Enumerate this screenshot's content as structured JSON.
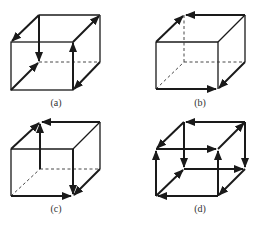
{
  "figure": {
    "panels": [
      {
        "id": "a",
        "label": "(a)",
        "origin": [
          11,
          15
        ],
        "description": "Cube with arrows: back-top-left vertical edge down, front-top-right vertical edge up, top-left depth edge toward front, bottom-left depth edge toward back, top-right depth edge toward back, bottom-right depth edge toward front",
        "arrows": [
          {
            "edge": "BTL-BBL",
            "dir": "down"
          },
          {
            "edge": "FBR-FTR",
            "dir": "up"
          },
          {
            "edge": "BTL-FTL",
            "dir": "to-front"
          },
          {
            "edge": "FBL-BBL",
            "dir": "to-back"
          },
          {
            "edge": "FTR-BTR",
            "dir": "to-back"
          },
          {
            "edge": "BBR-FBR",
            "dir": "to-front"
          }
        ]
      },
      {
        "id": "b",
        "label": "(b)",
        "origin": [
          156,
          15
        ],
        "description": "Cube with arrow loop: front-left-bottom to front-right-bottom, to back-right-top via right side, across back-top to left, down front-left-top",
        "arrows": [
          {
            "edge": "FTL-BTL",
            "dir": "to-back"
          },
          {
            "edge": "BTR-BTL",
            "dir": "left"
          },
          {
            "edge": "FBL-FBR",
            "dir": "right"
          },
          {
            "edge": "BBR-FBR",
            "dir": "to-front"
          }
        ]
      },
      {
        "id": "c",
        "label": "(c)",
        "origin": [
          11,
          122
        ],
        "description": "Cube with arrows: back-left vertical up, back-top leftward, front-left-top depth to back, front-right vertical down, front-bottom rightward, bottom-right depth to front",
        "arrows": [
          {
            "edge": "BBL-BTL",
            "dir": "up"
          },
          {
            "edge": "BTR-BTL",
            "dir": "left"
          },
          {
            "edge": "FTL-BTL",
            "dir": "to-back"
          },
          {
            "edge": "FTR-FBR",
            "dir": "down"
          },
          {
            "edge": "FBL-FBR",
            "dir": "right"
          },
          {
            "edge": "BBR-FBR",
            "dir": "to-front"
          }
        ]
      },
      {
        "id": "d",
        "label": "(d)",
        "origin": [
          156,
          122
        ],
        "description": "Cube with arrows on most edges forming circulation",
        "arrows": [
          {
            "edge": "BTR-BTL",
            "dir": "left"
          },
          {
            "edge": "BTL-FTL",
            "dir": "to-front"
          },
          {
            "edge": "FTL-FTR",
            "dir": "right"
          },
          {
            "edge": "FTR-BTR",
            "dir": "to-back"
          },
          {
            "edge": "BTL-BBL",
            "dir": "down"
          },
          {
            "edge": "BTR-BBR",
            "dir": "down"
          },
          {
            "edge": "FBL-FTL",
            "dir": "up"
          },
          {
            "edge": "FBR-FTR",
            "dir": "up"
          },
          {
            "edge": "BBL-BBR",
            "dir": "right"
          },
          {
            "edge": "FBR-FBL",
            "dir": "left"
          },
          {
            "edge": "FBL-BBL",
            "dir": "to-back"
          },
          {
            "edge": "BBR-FBR",
            "dir": "to-front"
          }
        ]
      }
    ],
    "caption": "Figure (faint, illegible)"
  },
  "labels": {
    "a": "(a)",
    "b": "(b)",
    "c": "(c)",
    "d": "(d)"
  }
}
